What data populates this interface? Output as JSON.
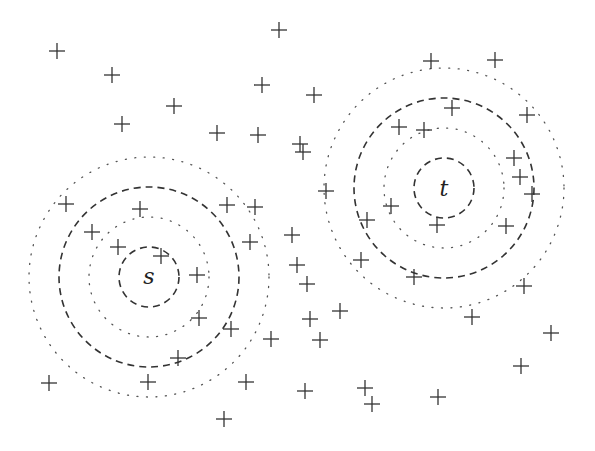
{
  "diagram": {
    "colors": {
      "ink": "#333333",
      "background": "#ffffff"
    },
    "cross_half_size": 8,
    "centers": [
      {
        "id": "s",
        "label": "s",
        "x": 149,
        "y": 277
      },
      {
        "id": "t",
        "label": "t",
        "x": 444,
        "y": 188
      }
    ],
    "rings": [
      {
        "center": "s",
        "r": 30,
        "style": "dashed"
      },
      {
        "center": "s",
        "r": 60,
        "style": "dotted"
      },
      {
        "center": "s",
        "r": 90,
        "style": "dashed"
      },
      {
        "center": "s",
        "r": 120,
        "style": "dotted"
      },
      {
        "center": "t",
        "r": 30,
        "style": "dashed"
      },
      {
        "center": "t",
        "r": 60,
        "style": "dotted"
      },
      {
        "center": "t",
        "r": 90,
        "style": "dashed"
      },
      {
        "center": "t",
        "r": 120,
        "style": "dotted"
      }
    ],
    "points": [
      [
        57,
        51
      ],
      [
        112,
        75
      ],
      [
        174,
        106
      ],
      [
        122,
        124
      ],
      [
        279,
        30
      ],
      [
        262,
        85
      ],
      [
        314,
        95
      ],
      [
        217,
        133
      ],
      [
        258,
        135
      ],
      [
        300,
        144
      ],
      [
        303,
        152
      ],
      [
        326,
        191
      ],
      [
        431,
        61
      ],
      [
        495,
        60
      ],
      [
        452,
        108
      ],
      [
        527,
        115
      ],
      [
        399,
        127
      ],
      [
        424,
        130
      ],
      [
        514,
        158
      ],
      [
        520,
        177
      ],
      [
        532,
        194
      ],
      [
        391,
        206
      ],
      [
        367,
        220
      ],
      [
        437,
        225
      ],
      [
        506,
        226
      ],
      [
        361,
        260
      ],
      [
        414,
        277
      ],
      [
        524,
        286
      ],
      [
        472,
        317
      ],
      [
        292,
        235
      ],
      [
        297,
        265
      ],
      [
        307,
        284
      ],
      [
        340,
        311
      ],
      [
        310,
        319
      ],
      [
        320,
        340
      ],
      [
        271,
        339
      ],
      [
        227,
        205
      ],
      [
        255,
        207
      ],
      [
        250,
        242
      ],
      [
        197,
        275
      ],
      [
        199,
        318
      ],
      [
        231,
        329
      ],
      [
        178,
        358
      ],
      [
        66,
        204
      ],
      [
        140,
        209
      ],
      [
        92,
        232
      ],
      [
        118,
        247
      ],
      [
        161,
        256
      ],
      [
        49,
        383
      ],
      [
        148,
        382
      ],
      [
        246,
        382
      ],
      [
        224,
        419
      ],
      [
        305,
        391
      ],
      [
        551,
        333
      ],
      [
        521,
        366
      ],
      [
        365,
        388
      ],
      [
        372,
        404
      ],
      [
        438,
        397
      ]
    ]
  }
}
